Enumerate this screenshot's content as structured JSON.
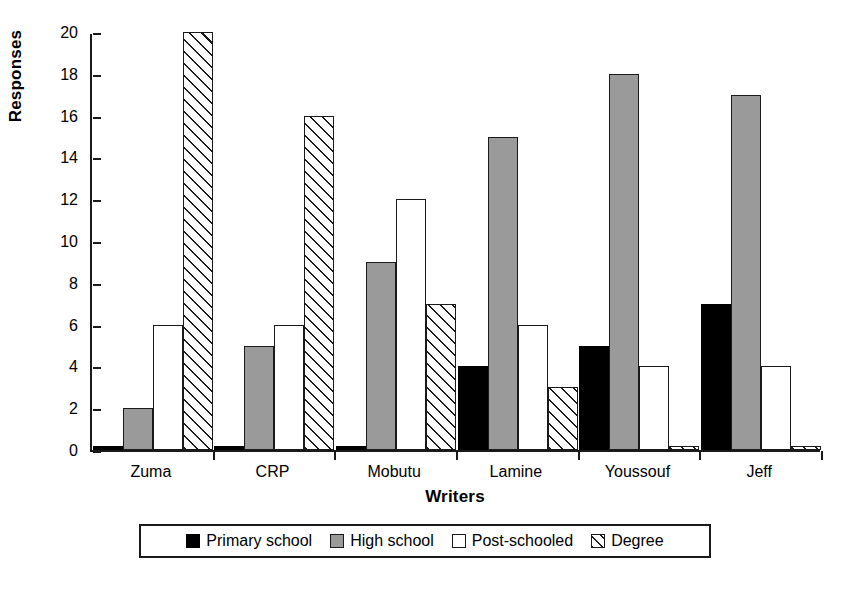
{
  "chart_data": {
    "type": "bar",
    "title": "",
    "xlabel": "Writers",
    "ylabel": "Responses",
    "categories": [
      "Zuma",
      "CRP",
      "Mobutu",
      "Lamine",
      "Youssouf",
      "Jeff"
    ],
    "series": [
      {
        "name": "Primary school",
        "values": [
          0.2,
          0.2,
          0.2,
          4,
          5,
          7
        ],
        "color": "#000000",
        "fill": "solid-black"
      },
      {
        "name": "High school",
        "values": [
          2,
          5,
          9,
          15,
          18,
          17
        ],
        "color": "#9a9a9a",
        "fill": "solid-gray"
      },
      {
        "name": "Post-schooled",
        "values": [
          6,
          6,
          12,
          6,
          4,
          4
        ],
        "color": "#ffffff",
        "fill": "white"
      },
      {
        "name": "Degree",
        "values": [
          20,
          16,
          7,
          3,
          0.2,
          0.2
        ],
        "color": "#ffffff",
        "fill": "diagonal-hatch"
      }
    ],
    "ylim": [
      0,
      20
    ],
    "yticks": [
      0,
      2,
      4,
      6,
      8,
      10,
      12,
      14,
      16,
      18,
      20
    ],
    "grid": false,
    "legend_position": "bottom"
  },
  "legend": {
    "items": [
      {
        "label": "Primary school"
      },
      {
        "label": "High school"
      },
      {
        "label": "Post-schooled"
      },
      {
        "label": "Degree"
      }
    ]
  },
  "colors": {
    "axis": "#1a1a1a",
    "primary_school": "#000000",
    "high_school": "#9a9a9a",
    "post_schooled": "#ffffff",
    "degree": "#ffffff",
    "background": "#ffffff"
  }
}
